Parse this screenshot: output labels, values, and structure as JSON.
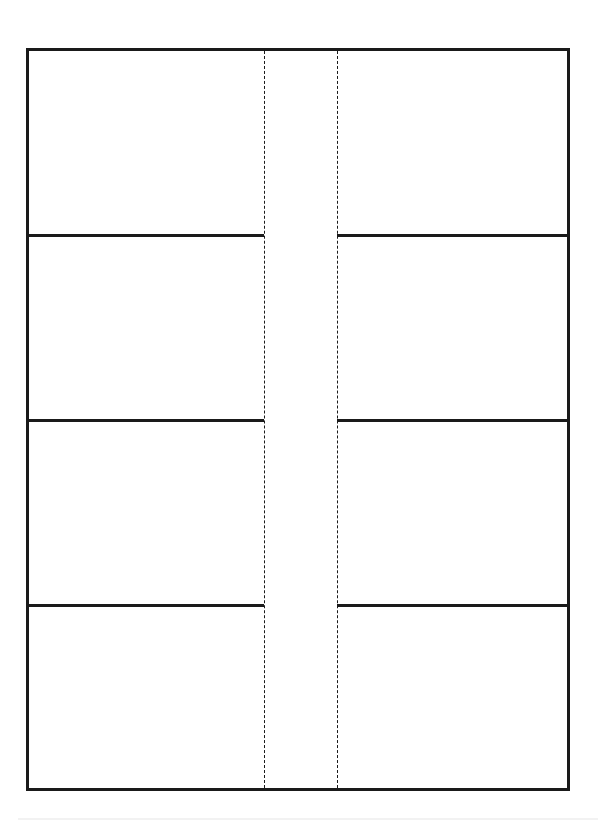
{
  "page": {
    "type": "label-sheet-template",
    "columns": 2,
    "rows": 4,
    "cells": [
      {
        "row": 1,
        "col": "left",
        "text": ""
      },
      {
        "row": 1,
        "col": "right",
        "text": ""
      },
      {
        "row": 2,
        "col": "left",
        "text": ""
      },
      {
        "row": 2,
        "col": "right",
        "text": ""
      },
      {
        "row": 3,
        "col": "left",
        "text": ""
      },
      {
        "row": 3,
        "col": "right",
        "text": ""
      },
      {
        "row": 4,
        "col": "left",
        "text": ""
      },
      {
        "row": 4,
        "col": "right",
        "text": ""
      }
    ],
    "colors": {
      "line": "#1a1a1a",
      "background": "#ffffff"
    }
  }
}
